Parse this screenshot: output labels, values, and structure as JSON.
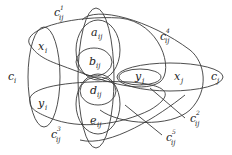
{
  "diagram": {
    "type": "gadget-graph",
    "nodes": {
      "c_i": {
        "base": "c",
        "sub": "i"
      },
      "c_j": {
        "base": "c",
        "sub": "j"
      },
      "x_i": {
        "base": "x",
        "sub": "i"
      },
      "y_i": {
        "base": "y",
        "sub": "i"
      },
      "x_j": {
        "base": "x",
        "sub": "j"
      },
      "y_j": {
        "base": "y",
        "sub": "j"
      },
      "a_ij": {
        "base": "a",
        "sub": "ij"
      },
      "b_ij": {
        "base": "b",
        "sub": "ij"
      },
      "d_ij": {
        "base": "d",
        "sub": "ij"
      },
      "e_ij": {
        "base": "e",
        "sub": "ij"
      }
    },
    "hyperedges": {
      "c1": {
        "base": "c",
        "sub": "ij",
        "sup": "1"
      },
      "c2": {
        "base": "c",
        "sub": "ij",
        "sup": "2"
      },
      "c3": {
        "base": "c",
        "sub": "ij",
        "sup": "3"
      },
      "c4": {
        "base": "c",
        "sub": "ij",
        "sup": "4"
      },
      "c5": {
        "base": "c",
        "sub": "ij",
        "sup": "5"
      }
    },
    "stroke_color": "#3a3a3a",
    "background": "#ffffff"
  }
}
